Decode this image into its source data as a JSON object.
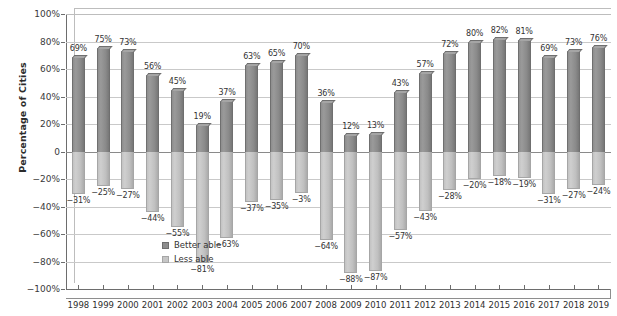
{
  "chart_data": {
    "type": "bar",
    "title": "",
    "xlabel": "",
    "ylabel": "Percentage of Cities",
    "ylim": [
      -100,
      100
    ],
    "grid": true,
    "legend_position": "inside-left",
    "categories": [
      "1998",
      "1999",
      "2000",
      "2001",
      "2002",
      "2003",
      "2004",
      "2005",
      "2006",
      "2007",
      "2008",
      "2009",
      "2010",
      "2011",
      "2012",
      "2013",
      "2014",
      "2015",
      "2016",
      "2017",
      "2018",
      "2019"
    ],
    "ytick_labels": [
      "100%",
      "80%",
      "60%",
      "40%",
      "20%",
      "0",
      "−20%",
      "−40%",
      "−60%",
      "−80%",
      "−100%"
    ],
    "ytick_values": [
      100,
      80,
      60,
      40,
      20,
      0,
      -20,
      -40,
      -60,
      -80,
      -100
    ],
    "series": [
      {
        "name": "Better able",
        "color": "#8e8e8e",
        "values": [
          69,
          75,
          73,
          56,
          45,
          19,
          37,
          63,
          65,
          70,
          36,
          12,
          13,
          43,
          57,
          72,
          80,
          82,
          81,
          69,
          73,
          76
        ],
        "labels": [
          "69%",
          "75%",
          "73%",
          "56%",
          "45%",
          "19%",
          "37%",
          "63%",
          "65%",
          "70%",
          "36%",
          "12%",
          "13%",
          "43%",
          "57%",
          "72%",
          "80%",
          "82%",
          "81%",
          "69%",
          "73%",
          "76%"
        ]
      },
      {
        "name": "Less able",
        "color": "#c6c6c6",
        "values": [
          -31,
          -25,
          -27,
          -44,
          -55,
          -81,
          -63,
          -37,
          -35,
          -30,
          -64,
          -88,
          -87,
          -57,
          -43,
          -28,
          -20,
          -18,
          -19,
          -31,
          -27,
          -24
        ],
        "labels": [
          "−31%",
          "−25%",
          "−27%",
          "−44%",
          "−55%",
          "−81%",
          "−63%",
          "−37%",
          "−35%",
          "−3%",
          "−64%",
          "−88%",
          "−87%",
          "−57%",
          "−43%",
          "−28%",
          "−20%",
          "−18%",
          "−19%",
          "−31%",
          "−27%",
          "−24%"
        ]
      }
    ]
  },
  "legend": {
    "items": [
      {
        "label": "Better able"
      },
      {
        "label": "Less able"
      }
    ]
  }
}
